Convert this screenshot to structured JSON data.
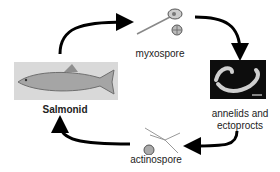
{
  "diagram": {
    "nodes": [
      {
        "id": "myxospore",
        "label": "myxospore"
      },
      {
        "id": "annelids",
        "label_line1": "annelids and",
        "label_line2": "ectoprocts"
      },
      {
        "id": "actinospore",
        "label": "actinospore"
      },
      {
        "id": "salmonid",
        "label": "Salmonid"
      }
    ],
    "edges": [
      {
        "from": "salmonid",
        "to": "myxospore"
      },
      {
        "from": "myxospore",
        "to": "annelids"
      },
      {
        "from": "annelids",
        "to": "actinospore"
      },
      {
        "from": "actinospore",
        "to": "salmonid"
      }
    ],
    "colors": {
      "arrow": "#000000",
      "text": "#222222",
      "fish_bg": "#d9d9d9",
      "worm_bg": "#0d0d0d"
    }
  }
}
